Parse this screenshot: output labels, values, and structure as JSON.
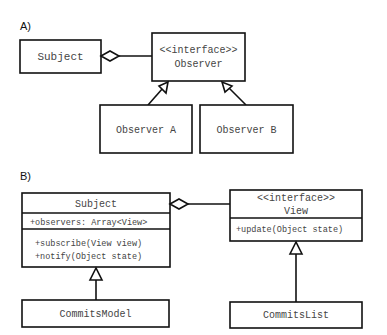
{
  "diagram_a": {
    "label": "A)",
    "subject": {
      "name": "Subject"
    },
    "observer": {
      "stereotype": "<<interface>>",
      "name": "Observer"
    },
    "observer_a": {
      "name": "Observer A"
    },
    "observer_b": {
      "name": "Observer B"
    },
    "relations": [
      {
        "type": "aggregation",
        "from": "Subject",
        "to": "Observer"
      },
      {
        "type": "realization",
        "from": "Observer A",
        "to": "Observer"
      },
      {
        "type": "realization",
        "from": "Observer B",
        "to": "Observer"
      }
    ]
  },
  "diagram_b": {
    "label": "B)",
    "subject": {
      "name": "Subject",
      "attributes": [
        "+observers: Array<View>"
      ],
      "methods": [
        "+subscribe(View view)",
        "+notify(Object state)"
      ]
    },
    "view": {
      "stereotype": "<<interface>>",
      "name": "View",
      "methods": [
        "+update(Object state)"
      ]
    },
    "commits_model": {
      "name": "CommitsModel"
    },
    "commits_list": {
      "name": "CommitsList"
    },
    "relations": [
      {
        "type": "aggregation",
        "from": "Subject",
        "to": "View"
      },
      {
        "type": "inheritance",
        "from": "CommitsModel",
        "to": "Subject"
      },
      {
        "type": "realization",
        "from": "CommitsList",
        "to": "View"
      }
    ]
  }
}
